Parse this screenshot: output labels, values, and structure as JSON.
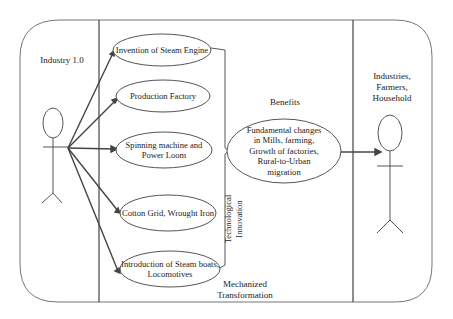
{
  "diagram": {
    "type": "use-case",
    "left_actor": {
      "label": "Industry 1.0"
    },
    "right_actor": {
      "label_lines": [
        "Industries,",
        "Farmers,",
        "Household"
      ]
    },
    "use_cases": [
      {
        "lines": [
          "Invention of Steam Engine"
        ]
      },
      {
        "lines": [
          "Production Factory"
        ]
      },
      {
        "lines": [
          "Spinning machine and",
          "Power Loom"
        ]
      },
      {
        "lines": [
          "Cotton Grid, Wrought Iron"
        ]
      },
      {
        "lines": [
          "Introduction of Steam boats,",
          "Locomotives"
        ]
      }
    ],
    "bracket_label": {
      "lines": [
        "Technological",
        "Innovation"
      ]
    },
    "benefits": {
      "heading": "Benefits",
      "lines": [
        "Fundamental changes",
        "in Mills, farming,",
        "Growth of factories,",
        "Rural-to-Urban",
        "migration"
      ]
    },
    "bottom_label": {
      "lines": [
        "Mechanized",
        "Transformation"
      ]
    },
    "colors": {
      "line": "#444444",
      "thin_line": "#777777",
      "background": "#ffffff"
    }
  }
}
